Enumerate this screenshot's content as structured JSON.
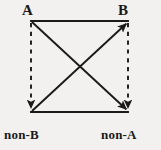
{
  "diagram": {
    "kind": "square-of-opposition",
    "title": "",
    "background_color": "#f2f1ef",
    "stroke_color": "#1a1a1a",
    "vertices": [
      {
        "id": "A",
        "label": "A",
        "position": "top-left",
        "x": 31,
        "y": 21
      },
      {
        "id": "B",
        "label": "B",
        "position": "top-right",
        "x": 128,
        "y": 21
      },
      {
        "id": "non-B",
        "label": "non-B",
        "position": "bottom-left",
        "x": 31,
        "y": 112
      },
      {
        "id": "non-A",
        "label": "non-A",
        "position": "bottom-right",
        "x": 128,
        "y": 112
      }
    ],
    "edges": [
      {
        "id": "top",
        "from": "A",
        "to": "B",
        "style": "solid",
        "arrow": "none"
      },
      {
        "id": "bottom",
        "from": "non-B",
        "to": "non-A",
        "style": "solid",
        "arrow": "none"
      },
      {
        "id": "left",
        "from": "A",
        "to": "non-B",
        "style": "dashed",
        "arrow": "end"
      },
      {
        "id": "right",
        "from": "B",
        "to": "non-A",
        "style": "dashed",
        "arrow": "end"
      },
      {
        "id": "diagonal-a",
        "from": "A",
        "to": "non-A",
        "style": "solid",
        "arrow": "end"
      },
      {
        "id": "diagonal-b",
        "from": "non-B",
        "to": "B",
        "style": "solid",
        "arrow": "end"
      }
    ]
  }
}
